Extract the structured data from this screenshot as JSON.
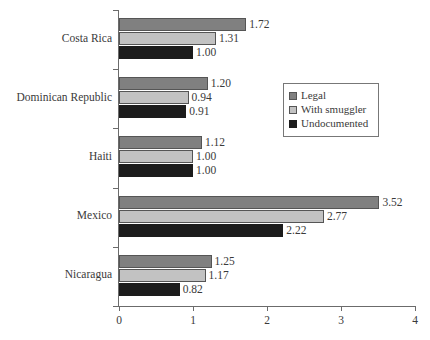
{
  "chart_data": {
    "type": "bar",
    "orientation": "horizontal",
    "title": "",
    "xlabel": "",
    "ylabel": "",
    "xlim": [
      0,
      4
    ],
    "xticks": [
      "0",
      "1",
      "2",
      "3",
      "4"
    ],
    "grid": false,
    "legend_position": "upper right",
    "categories": [
      "Costa Rica",
      "Dominican Republic",
      "Haiti",
      "Mexico",
      "Nicaragua"
    ],
    "series": [
      {
        "name": "Legal",
        "color": "#808080",
        "values": [
          1.72,
          1.2,
          1.12,
          3.52,
          1.25
        ],
        "labels": [
          "1.72",
          "1.20",
          "1.12",
          "3.52",
          "1.25"
        ]
      },
      {
        "name": "With smuggler",
        "color": "#c2c2c2",
        "values": [
          1.31,
          0.94,
          1.0,
          2.77,
          1.17
        ],
        "labels": [
          "1.31",
          "0.94",
          "1.00",
          "2.77",
          "1.17"
        ]
      },
      {
        "name": "Undocumented",
        "color": "#1c1c1c",
        "values": [
          1.0,
          0.91,
          1.0,
          2.22,
          0.82
        ],
        "labels": [
          "1.00",
          "0.91",
          "1.00",
          "2.22",
          "0.82"
        ]
      }
    ]
  },
  "axis": {
    "x_tick_labels": [
      "0",
      "1",
      "2",
      "3",
      "4"
    ]
  },
  "legend": {
    "items": [
      {
        "label": "Legal",
        "color": "#808080"
      },
      {
        "label": "With smuggler",
        "color": "#c2c2c2"
      },
      {
        "label": "Undocumented",
        "color": "#1c1c1c"
      }
    ]
  }
}
